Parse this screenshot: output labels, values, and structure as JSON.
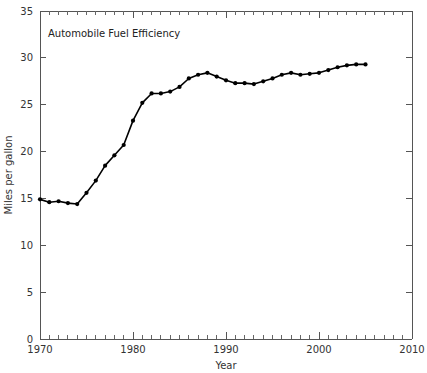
{
  "chart_data": {
    "type": "line",
    "title": "Automobile Fuel Efficiency",
    "xlabel": "Year",
    "ylabel": "Miles per gallon",
    "xlim": [
      1970,
      2010
    ],
    "ylim": [
      0,
      35
    ],
    "x_major_ticks": [
      1970,
      1980,
      1990,
      2000,
      2010
    ],
    "x_major_tick_labels": [
      "1970",
      "1980",
      "1990",
      "2000",
      "2010"
    ],
    "x_minor_tick_step": 1,
    "y_major_ticks": [
      0,
      5,
      10,
      15,
      20,
      25,
      30,
      35
    ],
    "y_major_tick_labels": [
      "0",
      "5",
      "10",
      "15",
      "20",
      "25",
      "30",
      "35"
    ],
    "grid": false,
    "legend": "none",
    "marker": "filled-circle",
    "line_color": "#000000",
    "marker_color": "#000000",
    "frame_color": "#555555",
    "background_color": "#ffffff",
    "series": [
      {
        "name": "Automobile Fuel Efficiency",
        "x": [
          1970,
          1971,
          1972,
          1973,
          1974,
          1975,
          1976,
          1977,
          1978,
          1979,
          1980,
          1981,
          1982,
          1983,
          1984,
          1985,
          1986,
          1987,
          1988,
          1989,
          1990,
          1991,
          1992,
          1993,
          1994,
          1995,
          1996,
          1997,
          1998,
          1999,
          2000,
          2001,
          2002,
          2003,
          2004,
          2005
        ],
        "values": [
          14.9,
          14.6,
          14.7,
          14.5,
          14.4,
          15.6,
          16.9,
          18.5,
          19.6,
          20.7,
          23.3,
          25.2,
          26.2,
          26.2,
          26.4,
          26.9,
          27.8,
          28.2,
          28.4,
          28.0,
          27.6,
          27.3,
          27.3,
          27.2,
          27.5,
          27.8,
          28.2,
          28.4,
          28.2,
          28.3,
          28.4,
          28.7,
          29.0,
          29.2,
          29.3,
          29.3
        ]
      }
    ]
  },
  "plot_geometry": {
    "left": 40,
    "right": 412,
    "top": 11,
    "bottom": 339
  }
}
